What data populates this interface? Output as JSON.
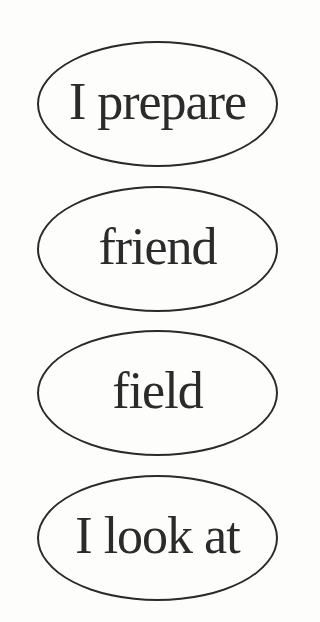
{
  "cards": [
    {
      "label": "I prepare"
    },
    {
      "label": "friend"
    },
    {
      "label": "field"
    },
    {
      "label": "I look at"
    }
  ]
}
